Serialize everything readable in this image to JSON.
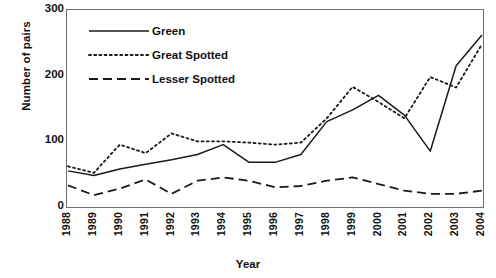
{
  "chart_data": {
    "type": "line",
    "title": "",
    "xlabel": "Year",
    "ylabel": "Number of pairs",
    "ylim": [
      0,
      300
    ],
    "yticks": [
      0,
      100,
      200,
      300
    ],
    "grid": false,
    "legend_position": "top-left inside plot",
    "categories": [
      "1988",
      "1989",
      "1990",
      "1991",
      "1992",
      "1993",
      "1994",
      "1995",
      "1996",
      "1997",
      "1998",
      "1999",
      "2000",
      "2001",
      "2002",
      "2003",
      "2004"
    ],
    "series": [
      {
        "name": "Green",
        "style": "solid",
        "values": [
          55,
          48,
          58,
          65,
          72,
          80,
          95,
          68,
          68,
          80,
          130,
          148,
          170,
          140,
          85,
          215,
          262
        ]
      },
      {
        "name": "Great Spotted",
        "style": "dotted",
        "values": [
          62,
          52,
          95,
          82,
          112,
          100,
          100,
          98,
          95,
          98,
          135,
          183,
          160,
          135,
          198,
          182,
          248
        ]
      },
      {
        "name": "Lesser Spotted",
        "style": "dashed",
        "values": [
          33,
          18,
          28,
          42,
          20,
          40,
          45,
          40,
          30,
          32,
          40,
          45,
          35,
          25,
          20,
          20,
          25
        ]
      }
    ]
  },
  "axis": {
    "y_ticks": [
      "0",
      "100",
      "200",
      "300"
    ],
    "x_ticks": [
      "1988",
      "1989",
      "1990",
      "1991",
      "1992",
      "1993",
      "1994",
      "1995",
      "1996",
      "1997",
      "1998",
      "1999",
      "2000",
      "2001",
      "2002",
      "2003",
      "2004"
    ],
    "y_title": "Number of pairs",
    "x_title": "Year"
  },
  "legend": {
    "items": [
      {
        "label": "Green",
        "style": "solid"
      },
      {
        "label": "Great Spotted",
        "style": "dotted"
      },
      {
        "label": "Lesser Spotted",
        "style": "dashed"
      }
    ]
  },
  "colors": {
    "line": "#1a1a1a",
    "axis": "#6f6f6f",
    "text": "#111111",
    "background": "#ffffff"
  }
}
